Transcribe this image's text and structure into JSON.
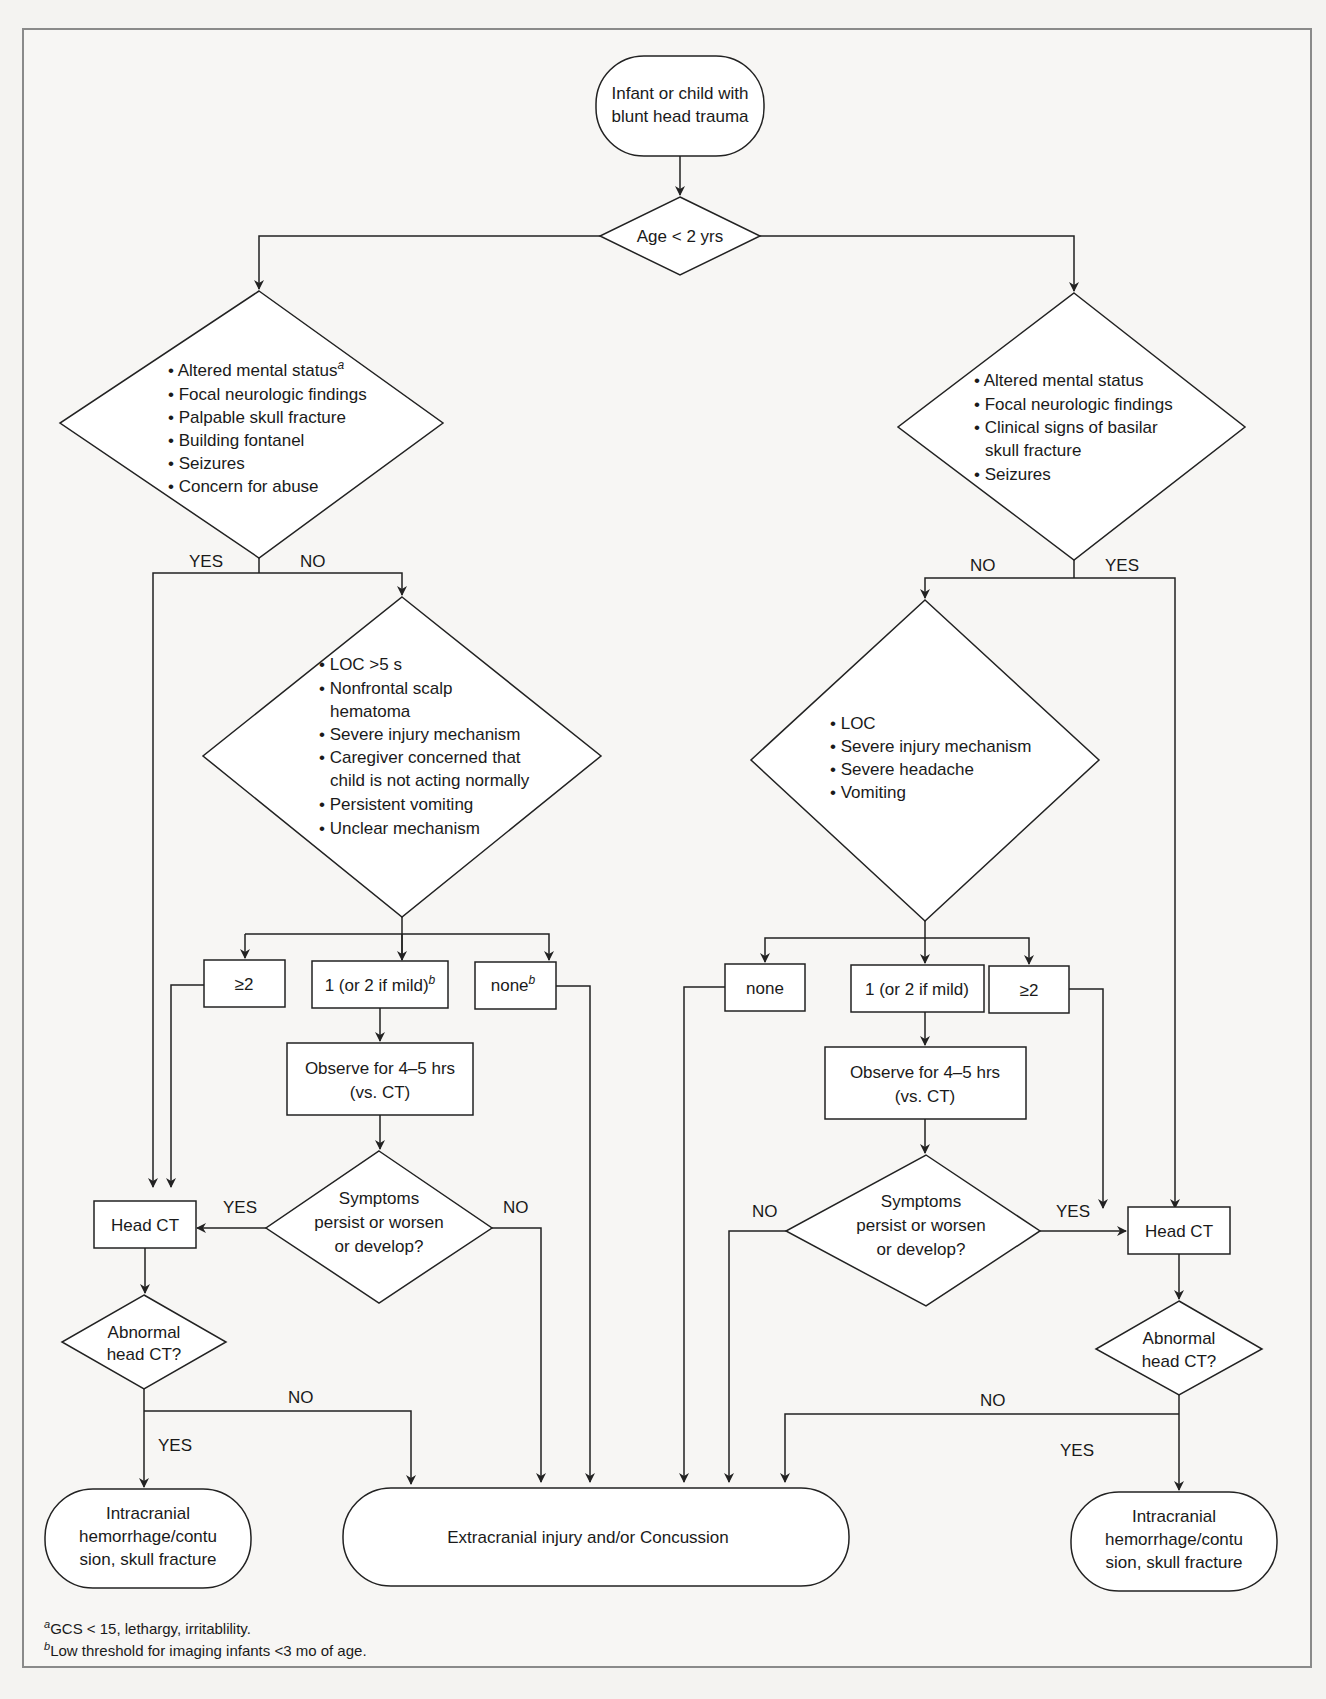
{
  "start": {
    "line1": "Infant or child with",
    "line2": "blunt head trauma"
  },
  "age_decision": {
    "label": "Age < 2 yrs"
  },
  "left": {
    "criteria": [
      "• Altered mental status",
      "• Focal neurologic findings",
      "• Palpable skull fracture",
      "• Building fontanel",
      "• Seizures",
      "• Concern for abuse"
    ],
    "criteria_sup": "a",
    "yes": "YES",
    "no": "NO",
    "secondary": [
      "• LOC >5 s",
      "• Nonfrontal scalp",
      "  hematoma",
      "• Severe injury mechanism",
      "• Caregiver concerned that",
      "  child is not acting normally",
      "• Persistent vomiting",
      "• Unclear mechanism"
    ],
    "count_ge2": "≥2",
    "count_1": "1 (or 2 if mild)",
    "count_1_sup": "b",
    "count_none": "none",
    "count_none_sup": "b",
    "observe": [
      "Observe for 4–5 hrs",
      "(vs. CT)"
    ],
    "symptoms": [
      "Symptoms",
      "persist or worsen",
      "or develop?"
    ],
    "sym_yes": "YES",
    "sym_no": "NO",
    "head_ct": "Head CT",
    "abnormal": [
      "Abnormal",
      "head CT?"
    ],
    "abn_yes": "YES",
    "abn_no": "NO",
    "outcome": [
      "Intracranial",
      "hemorrhage/contu",
      "sion, skull fracture"
    ]
  },
  "right": {
    "criteria": [
      "• Altered mental status",
      "• Focal neurologic findings",
      "• Clinical signs of basilar",
      "  skull fracture",
      "• Seizures"
    ],
    "yes": "YES",
    "no": "NO",
    "secondary": [
      "• LOC",
      "• Severe injury mechanism",
      "• Severe headache",
      "• Vomiting"
    ],
    "count_none": "none",
    "count_1": "1 (or 2 if mild)",
    "count_ge2": "≥2",
    "observe": [
      "Observe for 4–5 hrs",
      "(vs. CT)"
    ],
    "symptoms": [
      "Symptoms",
      "persist or worsen",
      "or develop?"
    ],
    "sym_yes": "YES",
    "sym_no": "NO",
    "head_ct": "Head CT",
    "abnormal": [
      "Abnormal",
      "head CT?"
    ],
    "abn_yes": "YES",
    "abn_no": "NO",
    "outcome": [
      "Intracranial",
      "hemorrhage/contu",
      "sion, skull fracture"
    ]
  },
  "center_outcome": "Extracranial injury and/or Concussion",
  "footnotes": {
    "a_sup": "a",
    "a_text": "GCS < 15, lethargy, irritablility.",
    "b_sup": "b",
    "b_text": "Low threshold for imaging infants <3 mo of age."
  }
}
